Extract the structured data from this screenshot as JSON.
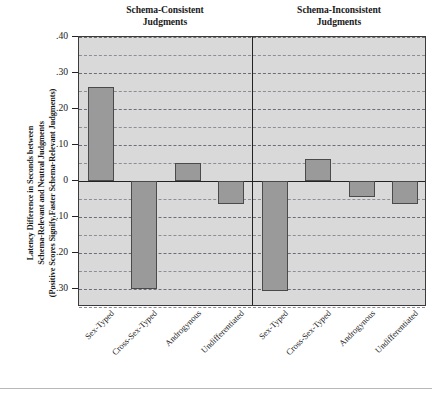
{
  "chart_data": {
    "type": "bar",
    "title": "",
    "ylabel": "Latency Difference in Seconds between Schema-Relevant and Neutral Judgments (Positive Scores Signify Faster Schema-Relevant Judgments)",
    "ylabel_lines": [
      "Latency Difference in Seconds between",
      "Schema-Relevant and Neutral Judgments",
      "(Positive Scores Signify Faster Schema-Relevant Judgments)"
    ],
    "xlabel": "",
    "ylim": [
      -0.35,
      0.4
    ],
    "ytick_values": [
      0.4,
      0.3,
      0.2,
      0.1,
      0,
      -0.1,
      -0.2,
      -0.3
    ],
    "ytick_labels": [
      ".40",
      ".30",
      ".20",
      ".10",
      "0",
      "-.10",
      "-.20",
      "-.30"
    ],
    "minor_gridline_values": [
      0.35,
      0.25,
      0.15,
      0.05,
      -0.05,
      -0.15,
      -0.25,
      -0.35
    ],
    "grid": true,
    "legend": "none",
    "categories": [
      "Sex-Typed",
      "Cross-Sex-Typed",
      "Androgynous",
      "Undifferentiated"
    ],
    "panels": [
      {
        "title_lines": [
          "Schema-Consistent",
          "Judgments"
        ],
        "title": "Schema-Consistent Judgments",
        "values": [
          0.26,
          -0.3,
          0.05,
          -0.065
        ]
      },
      {
        "title_lines": [
          "Schema-Inconsistent",
          "Judgments"
        ],
        "title": "Schema-Inconsistent Judgments",
        "values": [
          -0.305,
          0.06,
          -0.045,
          -0.065
        ]
      }
    ],
    "colors": {
      "bar_fill": "#9a9a9a",
      "bar_border": "#4a4a4a",
      "plot_background": "#d9d9d9",
      "axis": "#232323",
      "gridline": "#8d8d97",
      "page_background": "#ffffff"
    }
  }
}
